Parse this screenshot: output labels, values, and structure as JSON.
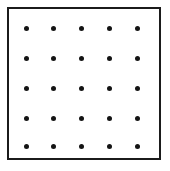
{
  "figure": {
    "caption": "",
    "background_color": "#ffffff",
    "border_color": "#1b1b1b",
    "dot_color": "#141414",
    "border_width_px": 2.5,
    "dot_diameter_px": 5,
    "frame": {
      "left": 7,
      "top": 7,
      "width": 154,
      "height": 153
    }
  },
  "chart_data": {
    "type": "scatter",
    "title": "",
    "xlabel": "",
    "ylabel": "",
    "grid": false,
    "legend": "none",
    "rows": 5,
    "columns": 5,
    "count": 25,
    "xlim": [
      0,
      170
    ],
    "ylim": [
      171,
      0
    ],
    "column_x": [
      26,
      53,
      81,
      109,
      137
    ],
    "row_y": [
      28,
      58,
      88,
      118,
      146
    ],
    "points": [
      {
        "x": 26,
        "y": 28
      },
      {
        "x": 53,
        "y": 28
      },
      {
        "x": 81,
        "y": 28
      },
      {
        "x": 109,
        "y": 28
      },
      {
        "x": 137,
        "y": 28
      },
      {
        "x": 26,
        "y": 58
      },
      {
        "x": 53,
        "y": 58
      },
      {
        "x": 81,
        "y": 58
      },
      {
        "x": 109,
        "y": 58
      },
      {
        "x": 137,
        "y": 58
      },
      {
        "x": 26,
        "y": 88
      },
      {
        "x": 53,
        "y": 88
      },
      {
        "x": 81,
        "y": 88
      },
      {
        "x": 109,
        "y": 88
      },
      {
        "x": 137,
        "y": 88
      },
      {
        "x": 26,
        "y": 118
      },
      {
        "x": 53,
        "y": 118
      },
      {
        "x": 81,
        "y": 118
      },
      {
        "x": 109,
        "y": 118
      },
      {
        "x": 137,
        "y": 118
      },
      {
        "x": 26,
        "y": 146
      },
      {
        "x": 53,
        "y": 146
      },
      {
        "x": 81,
        "y": 146
      },
      {
        "x": 109,
        "y": 146
      },
      {
        "x": 137,
        "y": 146
      }
    ]
  }
}
